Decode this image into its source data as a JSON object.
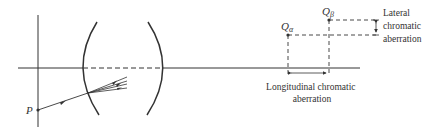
{
  "diagram": {
    "colors": {
      "ink": "#333333",
      "background": "#ffffff"
    },
    "point_p": {
      "label": "P"
    },
    "point_q_alpha": {
      "label": "Q",
      "subscript": "α"
    },
    "point_q_beta": {
      "label": "Q",
      "subscript": "β"
    },
    "lateral": {
      "line1": "Lateral",
      "line2": "chromatic",
      "line3": "aberration"
    },
    "longitudinal": {
      "line1": "Longitudinal chromatic",
      "line2": "aberration"
    }
  }
}
